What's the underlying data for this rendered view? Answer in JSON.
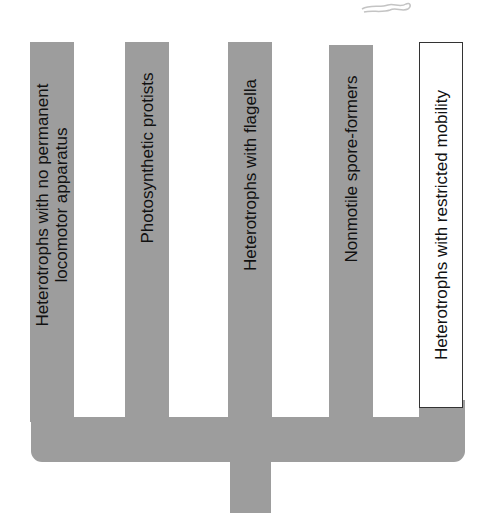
{
  "diagram": {
    "type": "tree",
    "colors": {
      "branch_fill": "#9d9d9d",
      "text": "#111111",
      "box_border": "#333333",
      "background": "#ffffff"
    },
    "branches": [
      {
        "label": "Heterotrophs with no permanent\nlocomotor apparatus",
        "line1": "Heterotrophs with no permanent",
        "line2": "locomotor apparatus"
      },
      {
        "label": "Photosynthetic protists"
      },
      {
        "label": "Heterotrophs with flagella"
      },
      {
        "label": "Nonmotile spore-formers"
      },
      {
        "label": "Heterotrophs with restricted mobility",
        "highlighted": true
      }
    ],
    "decoration": "partial-organism-sketch"
  }
}
